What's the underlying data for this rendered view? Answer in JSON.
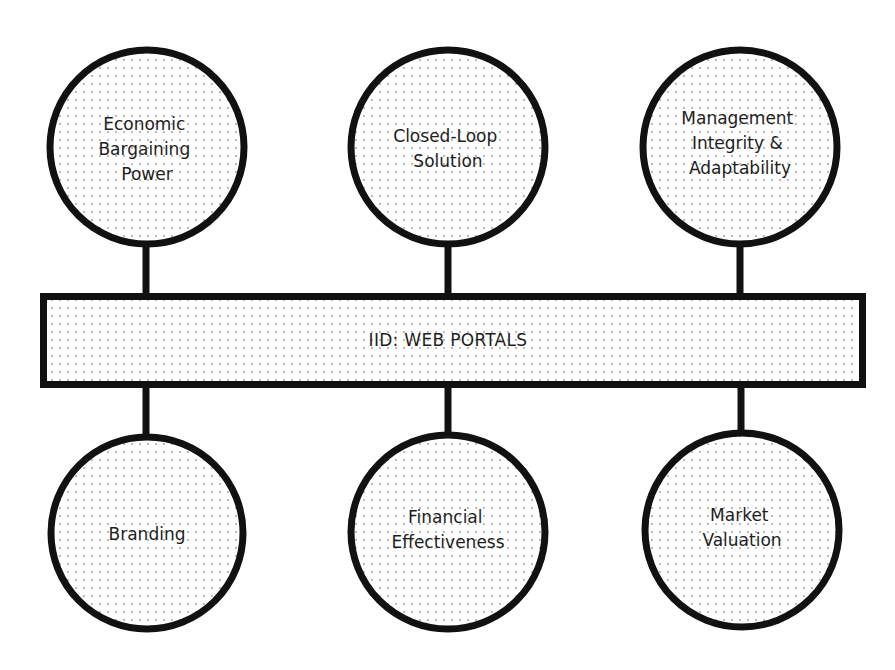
{
  "center": {
    "label": "IID: WEB PORTALS"
  },
  "nodes_top": [
    {
      "lines": [
        "Economic",
        "Bargaining",
        "Power"
      ]
    },
    {
      "lines": [
        "Closed-Loop",
        "Solution"
      ]
    },
    {
      "lines": [
        "Management",
        "Integrity &",
        "Adaptability"
      ]
    }
  ],
  "nodes_bottom": [
    {
      "lines": [
        "Branding"
      ]
    },
    {
      "lines": [
        "Financial",
        "Effectiveness"
      ]
    },
    {
      "lines": [
        "Market",
        "Valuation"
      ]
    }
  ],
  "colors": {
    "stroke": "#111111",
    "dot": "#9a9a9a",
    "fill": "#ffffff"
  }
}
